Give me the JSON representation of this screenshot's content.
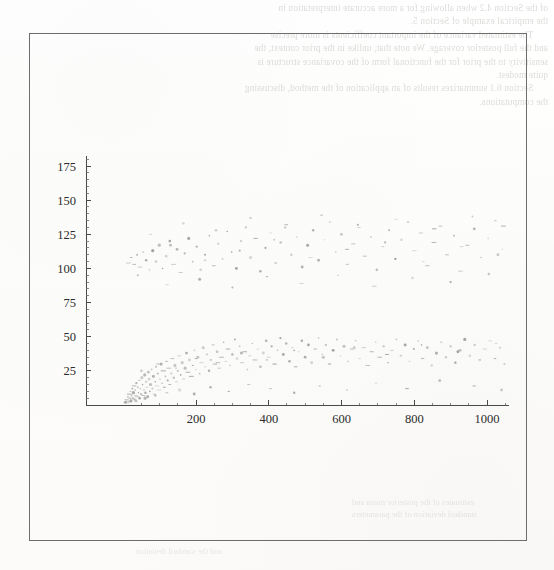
{
  "page": {
    "background_color": "#fdfdfc",
    "width": 554,
    "height": 570
  },
  "figure_box": {
    "border_color": "#6d6d6d",
    "x": 29,
    "y": 33,
    "width": 498,
    "height": 508
  },
  "bleed_through": {
    "description": "faint mirrored show-through text from the reverse side of the scanned page, not legible",
    "top_text": "of the Section 4.2 when allowing for a more accurate interpretation in\nthe empirical example of Section 5.\n      The estimated variance of the important coefficients is more precise\nand the full posterior coverage. We note that, unlike in the prior context, the\nsensitivity to the prior for the functional form of the covariance structure is\nquite modest.\n      Section 6.1 summarizes results of an application of the method, discussing\nthe computations.",
    "bottom_text": "estimates of the posterior mean and\nstandard deviation of the parameters",
    "footer_text": "and the standard deviation"
  },
  "chart_data": {
    "type": "scatter",
    "title": "",
    "xlabel": "",
    "ylabel": "",
    "xlim": [
      0,
      1060
    ],
    "ylim": [
      0,
      188
    ],
    "grid": false,
    "legend": false,
    "x_ticks": [
      200,
      400,
      600,
      800,
      1000
    ],
    "y_ticks": [
      25,
      50,
      75,
      100,
      125,
      150,
      175
    ],
    "x_minor_interval": 50,
    "y_minor_interval": 5,
    "point_color": "#8a8a8a",
    "point_size": 1.1,
    "axis_color": "#4a4a4a",
    "clusters": [
      {
        "name": "lower-fan",
        "description": "dense fan of points emanating from the origin, spreading upward with increasing x",
        "points": [
          [
            6,
            2
          ],
          [
            9,
            4
          ],
          [
            11,
            3
          ],
          [
            13,
            6
          ],
          [
            14,
            2
          ],
          [
            16,
            8
          ],
          [
            18,
            5
          ],
          [
            20,
            10
          ],
          [
            21,
            3
          ],
          [
            23,
            7
          ],
          [
            25,
            12
          ],
          [
            26,
            5
          ],
          [
            28,
            9
          ],
          [
            30,
            14
          ],
          [
            31,
            4
          ],
          [
            33,
            11
          ],
          [
            35,
            7
          ],
          [
            36,
            16
          ],
          [
            38,
            6
          ],
          [
            40,
            13
          ],
          [
            42,
            9
          ],
          [
            44,
            18
          ],
          [
            45,
            5
          ],
          [
            47,
            12
          ],
          [
            49,
            8
          ],
          [
            51,
            20
          ],
          [
            53,
            15
          ],
          [
            55,
            7
          ],
          [
            57,
            11
          ],
          [
            59,
            22
          ],
          [
            61,
            9
          ],
          [
            63,
            17
          ],
          [
            65,
            13
          ],
          [
            67,
            6
          ],
          [
            69,
            24
          ],
          [
            71,
            19
          ],
          [
            73,
            10
          ],
          [
            75,
            15
          ],
          [
            78,
            26
          ],
          [
            80,
            12
          ],
          [
            83,
            21
          ],
          [
            85,
            8
          ],
          [
            88,
            17
          ],
          [
            90,
            28
          ],
          [
            93,
            14
          ],
          [
            95,
            23
          ],
          [
            98,
            11
          ],
          [
            101,
            19
          ],
          [
            104,
            30
          ],
          [
            107,
            16
          ],
          [
            110,
            25
          ],
          [
            113,
            13
          ],
          [
            116,
            21
          ],
          [
            119,
            32
          ],
          [
            122,
            18
          ],
          [
            125,
            27
          ],
          [
            128,
            15
          ],
          [
            132,
            23
          ],
          [
            135,
            34
          ],
          [
            139,
            20
          ],
          [
            142,
            29
          ],
          [
            146,
            17
          ],
          [
            150,
            25
          ],
          [
            154,
            36
          ],
          [
            158,
            22
          ],
          [
            162,
            31
          ],
          [
            166,
            19
          ],
          [
            170,
            27
          ],
          [
            174,
            38
          ],
          [
            178,
            24
          ],
          [
            182,
            33
          ],
          [
            187,
            21
          ],
          [
            191,
            29
          ],
          [
            196,
            40
          ],
          [
            200,
            26
          ],
          [
            205,
            35
          ],
          [
            210,
            23
          ],
          [
            215,
            31
          ],
          [
            220,
            42
          ],
          [
            225,
            28
          ],
          [
            230,
            37
          ],
          [
            236,
            25
          ],
          [
            241,
            33
          ],
          [
            247,
            44
          ],
          [
            252,
            30
          ],
          [
            258,
            39
          ],
          [
            264,
            27
          ],
          [
            270,
            35
          ],
          [
            276,
            46
          ],
          [
            282,
            32
          ],
          [
            288,
            41
          ],
          [
            294,
            29
          ],
          [
            300,
            37
          ],
          [
            307,
            48
          ],
          [
            313,
            34
          ],
          [
            320,
            43
          ],
          [
            327,
            31
          ],
          [
            334,
            39
          ],
          [
            341,
            26
          ],
          [
            348,
            36
          ],
          [
            355,
            45
          ],
          [
            362,
            33
          ],
          [
            370,
            41
          ],
          [
            377,
            28
          ],
          [
            385,
            38
          ],
          [
            393,
            47
          ],
          [
            400,
            35
          ],
          [
            408,
            43
          ],
          [
            416,
            30
          ],
          [
            424,
            40
          ],
          [
            432,
            49
          ],
          [
            440,
            37
          ],
          [
            448,
            45
          ],
          [
            457,
            32
          ],
          [
            465,
            42
          ],
          [
            474,
            28
          ],
          [
            482,
            39
          ],
          [
            491,
            47
          ],
          [
            500,
            35
          ],
          [
            509,
            44
          ],
          [
            518,
            31
          ],
          [
            528,
            41
          ],
          [
            537,
            49
          ],
          [
            547,
            37
          ],
          [
            557,
            44
          ],
          [
            567,
            30
          ],
          [
            577,
            40
          ],
          [
            587,
            48
          ],
          [
            597,
            36
          ],
          [
            607,
            43
          ],
          [
            618,
            32
          ],
          [
            628,
            41
          ],
          [
            639,
            47
          ],
          [
            650,
            34
          ],
          [
            661,
            42
          ],
          [
            672,
            29
          ],
          [
            683,
            39
          ],
          [
            694,
            46
          ],
          [
            705,
            35
          ],
          [
            716,
            43
          ],
          [
            728,
            31
          ],
          [
            739,
            40
          ],
          [
            751,
            48
          ],
          [
            763,
            36
          ],
          [
            775,
            44
          ],
          [
            787,
            32
          ],
          [
            799,
            41
          ],
          [
            811,
            47
          ],
          [
            823,
            34
          ],
          [
            836,
            42
          ],
          [
            848,
            29
          ],
          [
            861,
            38
          ],
          [
            874,
            46
          ],
          [
            887,
            35
          ],
          [
            900,
            43
          ],
          [
            913,
            31
          ],
          [
            926,
            40
          ],
          [
            939,
            48
          ],
          [
            953,
            36
          ],
          [
            966,
            44
          ],
          [
            980,
            33
          ],
          [
            994,
            41
          ],
          [
            1008,
            47
          ],
          [
            1022,
            34
          ],
          [
            1036,
            42
          ],
          [
            1048,
            30
          ],
          [
            35,
            3
          ],
          [
            60,
            5
          ],
          [
            88,
            7
          ],
          [
            120,
            9
          ],
          [
            155,
            11
          ],
          [
            195,
            8
          ],
          [
            240,
            13
          ],
          [
            290,
            10
          ],
          [
            345,
            15
          ],
          [
            405,
            12
          ],
          [
            470,
            9
          ],
          [
            540,
            14
          ],
          [
            615,
            11
          ],
          [
            695,
            16
          ],
          [
            780,
            12
          ],
          [
            870,
            18
          ],
          [
            965,
            14
          ],
          [
            1040,
            11
          ],
          [
            50,
            25
          ],
          [
            95,
            30
          ],
          [
            145,
            27
          ],
          [
            200,
            34
          ],
          [
            260,
            31
          ],
          [
            325,
            38
          ],
          [
            395,
            33
          ],
          [
            470,
            40
          ],
          [
            550,
            35
          ],
          [
            635,
            42
          ],
          [
            725,
            37
          ],
          [
            820,
            44
          ],
          [
            920,
            39
          ],
          [
            1025,
            45
          ]
        ]
      },
      {
        "name": "upper-band",
        "description": "diffuse horizontal band of sparser points between about 85 and 138",
        "points": [
          [
            14,
            104
          ],
          [
            22,
            108
          ],
          [
            30,
            103
          ],
          [
            38,
            110
          ],
          [
            46,
            101
          ],
          [
            55,
            112
          ],
          [
            63,
            106
          ],
          [
            72,
            99
          ],
          [
            81,
            113
          ],
          [
            90,
            105
          ],
          [
            99,
            117
          ],
          [
            108,
            100
          ],
          [
            118,
            109
          ],
          [
            128,
            120
          ],
          [
            138,
            103
          ],
          [
            148,
            114
          ],
          [
            158,
            97
          ],
          [
            169,
            111
          ],
          [
            180,
            122
          ],
          [
            191,
            105
          ],
          [
            202,
            116
          ],
          [
            213,
            99
          ],
          [
            225,
            110
          ],
          [
            237,
            124
          ],
          [
            249,
            102
          ],
          [
            261,
            118
          ],
          [
            273,
            107
          ],
          [
            286,
            127
          ],
          [
            298,
            112
          ],
          [
            311,
            100
          ],
          [
            324,
            120
          ],
          [
            337,
            130
          ],
          [
            350,
            108
          ],
          [
            364,
            122
          ],
          [
            377,
            98
          ],
          [
            391,
            115
          ],
          [
            405,
            126
          ],
          [
            419,
            104
          ],
          [
            433,
            119
          ],
          [
            448,
            132
          ],
          [
            462,
            110
          ],
          [
            477,
            123
          ],
          [
            492,
            101
          ],
          [
            507,
            117
          ],
          [
            522,
            128
          ],
          [
            537,
            106
          ],
          [
            553,
            121
          ],
          [
            568,
            134
          ],
          [
            584,
            112
          ],
          [
            600,
            125
          ],
          [
            616,
            103
          ],
          [
            632,
            118
          ],
          [
            648,
            130
          ],
          [
            664,
            109
          ],
          [
            681,
            123
          ],
          [
            697,
            99
          ],
          [
            714,
            116
          ],
          [
            731,
            128
          ],
          [
            748,
            107
          ],
          [
            765,
            121
          ],
          [
            783,
            134
          ],
          [
            800,
            113
          ],
          [
            818,
            126
          ],
          [
            836,
            102
          ],
          [
            854,
            119
          ],
          [
            872,
            131
          ],
          [
            890,
            110
          ],
          [
            909,
            124
          ],
          [
            927,
            98
          ],
          [
            946,
            117
          ],
          [
            965,
            129
          ],
          [
            984,
            108
          ],
          [
            1003,
            122
          ],
          [
            1023,
            135
          ],
          [
            1042,
            114
          ],
          [
            120,
            88
          ],
          [
            210,
            92
          ],
          [
            300,
            86
          ],
          [
            395,
            94
          ],
          [
            490,
            89
          ],
          [
            590,
            95
          ],
          [
            690,
            87
          ],
          [
            795,
            93
          ],
          [
            900,
            90
          ],
          [
            1005,
            96
          ],
          [
            75,
            125
          ],
          [
            165,
            133
          ],
          [
            255,
            128
          ],
          [
            350,
            137
          ],
          [
            445,
            130
          ],
          [
            545,
            139
          ],
          [
            645,
            132
          ],
          [
            750,
            136
          ],
          [
            855,
            129
          ],
          [
            960,
            138
          ],
          [
            1045,
            131
          ],
          [
            40,
            95
          ],
          [
            130,
            117
          ],
          [
            225,
            106
          ],
          [
            320,
            113
          ],
          [
            415,
            121
          ],
          [
            515,
            108
          ],
          [
            615,
            114
          ],
          [
            720,
            119
          ],
          [
            825,
            105
          ],
          [
            930,
            116
          ],
          [
            1030,
            110
          ]
        ]
      }
    ]
  }
}
